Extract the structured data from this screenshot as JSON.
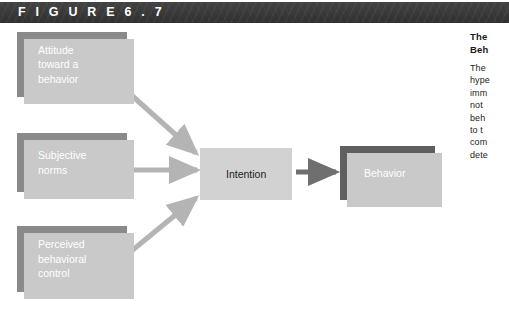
{
  "header": {
    "label": "F I G U R E    6 . 7",
    "figure_word": "FIGURE",
    "figure_number": "6.7",
    "background_color": "#3b3b3b",
    "text_color": "#ffffff"
  },
  "diagram": {
    "type": "flow-diagram",
    "nodes": [
      {
        "id": "attitude",
        "label": "Attitude\ntoward a\nbehavior",
        "fill": "#8a8a8a",
        "text_color": "#ffffff"
      },
      {
        "id": "subjective",
        "label": "Subjective\nnorms",
        "fill": "#8a8a8a",
        "text_color": "#ffffff"
      },
      {
        "id": "perceived",
        "label": "Perceived\nbehavioral\ncontrol",
        "fill": "#8a8a8a",
        "text_color": "#ffffff"
      },
      {
        "id": "intention",
        "label": "Intention",
        "fill": "#d2d2d2",
        "text_color": "#1d1d1d"
      },
      {
        "id": "behavior",
        "label": "Behavior",
        "fill": "#5f5f5f",
        "text_color": "#ffffff"
      }
    ],
    "edges": [
      {
        "from": "attitude",
        "to": "intention",
        "style": "arrow",
        "color": "#b4b4b4"
      },
      {
        "from": "subjective",
        "to": "intention",
        "style": "arrow",
        "color": "#b4b4b4"
      },
      {
        "from": "perceived",
        "to": "intention",
        "style": "arrow",
        "color": "#b4b4b4"
      },
      {
        "from": "intention",
        "to": "behavior",
        "style": "arrow",
        "color": "#6f6f6f"
      }
    ]
  },
  "caption": {
    "title": "The\nBeh",
    "body": "The\nhype\nimm\nnot\nbeh\nto t\ncom\ndete"
  }
}
